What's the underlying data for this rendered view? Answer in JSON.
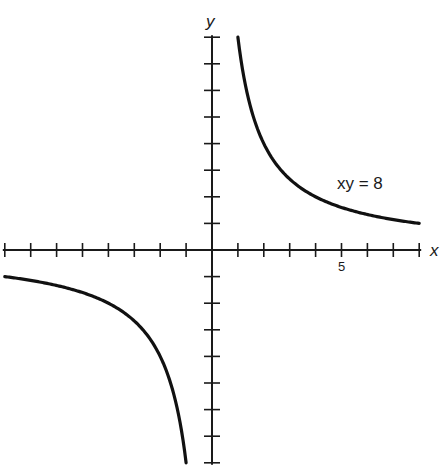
{
  "chart_data": {
    "type": "line",
    "title": "",
    "xlabel": "x",
    "ylabel": "y",
    "xlim": [
      -8,
      8
    ],
    "ylim": [
      -8,
      8
    ],
    "grid": false,
    "x_ticks": [
      -8,
      -7,
      -6,
      -5,
      -4,
      -3,
      -2,
      -1,
      1,
      2,
      3,
      4,
      5,
      6,
      7,
      8
    ],
    "y_ticks": [
      -8,
      -7,
      -6,
      -5,
      -4,
      -3,
      -2,
      -1,
      1,
      2,
      3,
      4,
      5,
      6,
      7,
      8
    ],
    "tick_labels": [
      {
        "axis": "x",
        "value": 5,
        "text": "5"
      }
    ],
    "annotation": {
      "text": "xy = 8",
      "x": 5.5,
      "y": 2.6
    },
    "series": [
      {
        "name": "xy = 8 (first quadrant branch)",
        "x": [
          1,
          1.25,
          1.5,
          2,
          2.5,
          3,
          4,
          5,
          6,
          7,
          8
        ],
        "y": [
          8,
          6.4,
          5.33,
          4,
          3.2,
          2.67,
          2,
          1.6,
          1.33,
          1.14,
          1
        ]
      },
      {
        "name": "xy = 8 (third quadrant branch)",
        "x": [
          -8,
          -7,
          -6,
          -5,
          -4,
          -3,
          -2.5,
          -2,
          -1.5,
          -1.25,
          -1
        ],
        "y": [
          -1,
          -1.14,
          -1.33,
          -1.6,
          -2,
          -2.67,
          -3.2,
          -4,
          -5.33,
          -6.4,
          -8
        ]
      }
    ]
  }
}
